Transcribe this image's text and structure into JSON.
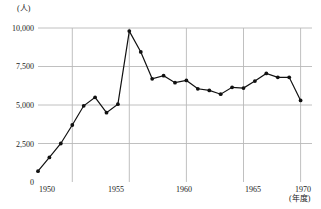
{
  "chart_data": {
    "type": "line",
    "title": "",
    "xlabel": "年度",
    "ylabel": "人",
    "y_unit_label": "(人)",
    "x_unit_label": "(年度)",
    "xlim": [
      1947,
      1971
    ],
    "ylim": [
      0,
      10000
    ],
    "y_ticks": [
      0,
      2500,
      5000,
      7500,
      10000
    ],
    "y_tick_labels": [
      "0",
      "2,500",
      "5,000",
      "7,500",
      "10,000"
    ],
    "x_ticks": [
      1950,
      1955,
      1960,
      1965,
      1970
    ],
    "x_tick_labels": [
      "1950",
      "1955",
      "1960",
      "1965",
      "1970"
    ],
    "grid": true,
    "grid_color": "#b9b9b9",
    "line_color": "#111111",
    "marker": "circle",
    "legend": null,
    "x": [
      1947,
      1948,
      1949,
      1950,
      1951,
      1952,
      1953,
      1954,
      1955,
      1956,
      1957,
      1958,
      1959,
      1960,
      1961,
      1962,
      1963,
      1964,
      1965,
      1966,
      1967,
      1968,
      1969,
      1970
    ],
    "values": [
      700,
      1600,
      2500,
      3700,
      4950,
      5500,
      4500,
      5050,
      9800,
      8450,
      6700,
      6900,
      6450,
      6600,
      6050,
      5950,
      5700,
      6150,
      6100,
      6550,
      7050,
      6800,
      6800,
      5300
    ],
    "series": [
      {
        "name": "人数",
        "values": [
          700,
          1600,
          2500,
          3700,
          4950,
          5500,
          4500,
          5050,
          9800,
          8450,
          6700,
          6900,
          6450,
          6600,
          6050,
          5950,
          5700,
          6150,
          6100,
          6550,
          7050,
          6800,
          6800,
          5300
        ]
      }
    ]
  }
}
